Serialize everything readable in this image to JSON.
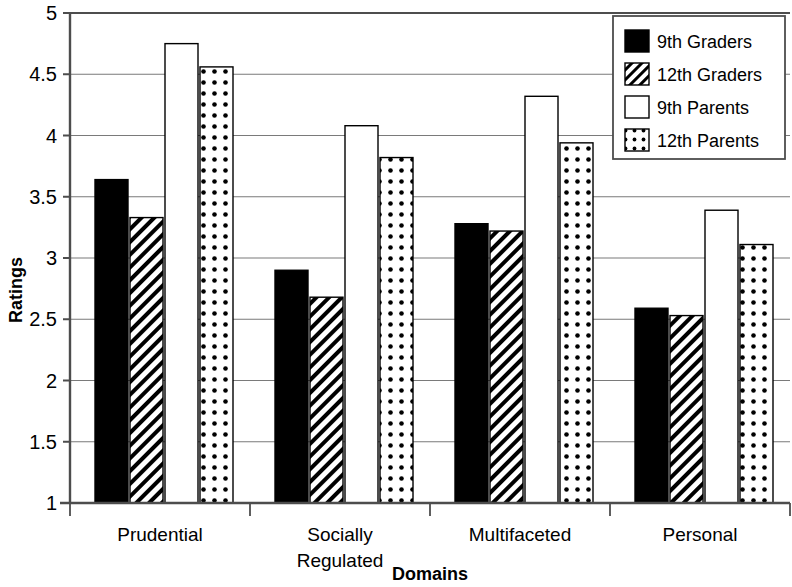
{
  "chart_data": {
    "type": "bar",
    "title": "",
    "xlabel": "Domains",
    "ylabel": "Ratings",
    "ylim": [
      1,
      5
    ],
    "ytick_step": 0.5,
    "ytick_labels": [
      "5",
      "4.5",
      "4",
      "3.5",
      "3",
      "2.5",
      "2",
      "1.5",
      "1"
    ],
    "ytick_values": [
      5,
      4.5,
      4,
      3.5,
      3,
      2.5,
      2,
      1.5,
      1
    ],
    "grid": true,
    "grid_axis": "y",
    "legend_position": "top-right",
    "categories": [
      "Prudential",
      "Socially Regulated",
      "Multifaceted",
      "Personal"
    ],
    "category_label_lines": [
      [
        "Prudential"
      ],
      [
        "Socially",
        "Regulated"
      ],
      [
        "Multifaceted"
      ],
      [
        "Personal"
      ]
    ],
    "series": [
      {
        "name": "9th Graders",
        "fill": "solid-black",
        "values": [
          3.64,
          2.9,
          3.28,
          2.59
        ]
      },
      {
        "name": "12th Graders",
        "fill": "diagonal-hatch",
        "values": [
          3.33,
          2.68,
          3.22,
          2.53
        ]
      },
      {
        "name": "9th Parents",
        "fill": "white",
        "values": [
          4.75,
          4.08,
          4.32,
          3.39
        ]
      },
      {
        "name": "12th Parents",
        "fill": "dotted",
        "values": [
          4.56,
          3.82,
          3.94,
          3.11
        ]
      }
    ]
  },
  "legend": {
    "items": [
      {
        "label": "9th Graders",
        "swatch": "solid-black"
      },
      {
        "label": "12th Graders",
        "swatch": "diagonal-hatch"
      },
      {
        "label": "9th Parents",
        "swatch": "white"
      },
      {
        "label": "12th Parents",
        "swatch": "dotted"
      }
    ]
  },
  "colors": {
    "series_black": "#000000",
    "background": "#ffffff",
    "axis": "#4d4d4d",
    "grid": "#7a7a7a",
    "bar_outline": "#000000"
  }
}
